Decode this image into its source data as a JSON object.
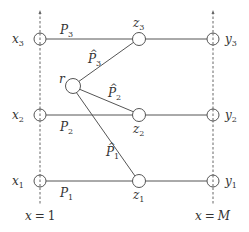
{
  "diagram": {
    "axes": [
      {
        "id": "left",
        "x": 40,
        "label": "x = 1",
        "label_var": "x",
        "label_val": "1"
      },
      {
        "id": "right",
        "x": 213,
        "label": "x = M",
        "label_var": "x",
        "label_val": "M"
      }
    ],
    "left_nodes": [
      {
        "id": "x3",
        "var": "x",
        "sub": "3",
        "y": 39
      },
      {
        "id": "x2",
        "var": "x",
        "sub": "2",
        "y": 115
      },
      {
        "id": "x1",
        "var": "x",
        "sub": "1",
        "y": 181
      }
    ],
    "middle_nodes": [
      {
        "id": "z3",
        "var": "z",
        "sub": "3",
        "x": 139,
        "y": 39
      },
      {
        "id": "z2",
        "var": "z",
        "sub": "2",
        "x": 139,
        "y": 115
      },
      {
        "id": "z1",
        "var": "z",
        "sub": "1",
        "x": 139,
        "y": 181
      }
    ],
    "right_nodes": [
      {
        "id": "y3",
        "var": "y",
        "sub": "3",
        "y": 39
      },
      {
        "id": "y2",
        "var": "y",
        "sub": "2",
        "y": 115
      },
      {
        "id": "y1",
        "var": "y",
        "sub": "1",
        "y": 181
      }
    ],
    "relay": {
      "id": "r",
      "label": "r",
      "x": 73,
      "y": 86
    },
    "path_labels": {
      "P3": {
        "var": "P",
        "sub": "3",
        "hat": false
      },
      "P2": {
        "var": "P",
        "sub": "2",
        "hat": false
      },
      "P1": {
        "var": "P",
        "sub": "1",
        "hat": false
      },
      "P3hat": {
        "var": "P",
        "sub": "3",
        "hat": true
      },
      "P2hat": {
        "var": "P",
        "sub": "2",
        "hat": true
      },
      "P1hat": {
        "var": "P",
        "sub": "1",
        "hat": true
      }
    },
    "hat_glyph": "^"
  }
}
